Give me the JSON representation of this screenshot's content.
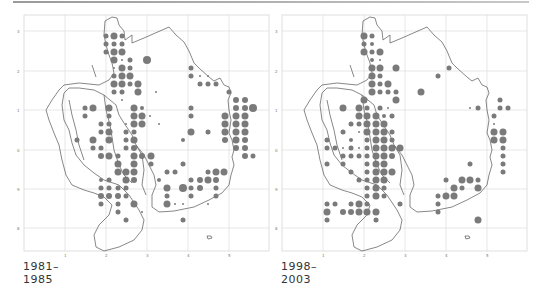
{
  "figure": {
    "panels": [
      {
        "caption": "1981–1985",
        "x_ticks": [
          "1",
          "2",
          "3",
          "4",
          "5"
        ],
        "y_ticks": [
          "3",
          "2",
          "1",
          "0",
          "9",
          "8"
        ]
      },
      {
        "caption": "1998–2003",
        "x_ticks": [
          "1",
          "2",
          "3",
          "4",
          "5"
        ],
        "y_ticks": [
          "3",
          "2",
          "1",
          "0",
          "9",
          "8"
        ]
      }
    ],
    "dot_color": "#7a7a7a",
    "outline_color": "#555555",
    "grid_color": "#d9d9d9"
  },
  "dots": {
    "p1": [
      [
        82,
        5,
        2.5
      ],
      [
        90,
        5,
        3.5
      ],
      [
        98,
        5,
        2.5
      ],
      [
        82,
        13,
        2.5
      ],
      [
        90,
        13,
        2.5
      ],
      [
        98,
        13,
        2.5
      ],
      [
        82,
        21,
        2.5
      ],
      [
        90,
        21,
        3.5
      ],
      [
        98,
        21,
        3.5
      ],
      [
        90,
        29,
        3.5
      ],
      [
        98,
        29,
        1
      ],
      [
        106,
        29,
        2.5
      ],
      [
        123,
        29,
        4
      ],
      [
        90,
        37,
        1
      ],
      [
        98,
        37,
        3.5
      ],
      [
        106,
        37,
        2.5
      ],
      [
        167,
        37,
        2.5
      ],
      [
        90,
        45,
        2.5
      ],
      [
        98,
        45,
        3.5
      ],
      [
        106,
        45,
        3.5
      ],
      [
        167,
        45,
        2.5
      ],
      [
        176,
        45,
        1
      ],
      [
        184,
        45,
        1
      ],
      [
        90,
        53,
        3.5
      ],
      [
        98,
        53,
        3.5
      ],
      [
        106,
        53,
        2.5
      ],
      [
        114,
        53,
        3.5
      ],
      [
        176,
        53,
        2.5
      ],
      [
        184,
        53,
        2.5
      ],
      [
        192,
        53,
        2.5
      ],
      [
        90,
        61,
        2.5
      ],
      [
        98,
        61,
        2.5
      ],
      [
        114,
        61,
        3.5
      ],
      [
        132,
        61,
        1
      ],
      [
        205,
        61,
        2.5
      ],
      [
        98,
        69,
        1
      ],
      [
        212,
        69,
        3
      ],
      [
        221,
        69,
        3
      ],
      [
        61,
        77,
        2.5
      ],
      [
        69,
        77,
        3.5
      ],
      [
        85,
        77,
        3.5
      ],
      [
        110,
        77,
        3.5
      ],
      [
        118,
        77,
        2
      ],
      [
        167,
        77,
        2.5
      ],
      [
        212,
        77,
        3
      ],
      [
        221,
        77,
        3
      ],
      [
        229,
        77,
        4
      ],
      [
        61,
        85,
        2.5
      ],
      [
        85,
        85,
        2.5
      ],
      [
        110,
        85,
        3.5
      ],
      [
        118,
        85,
        3.5
      ],
      [
        126,
        85,
        1
      ],
      [
        167,
        85,
        2.5
      ],
      [
        201,
        85,
        3.5
      ],
      [
        212,
        85,
        3.5
      ],
      [
        221,
        85,
        3.5
      ],
      [
        77,
        93,
        2.5
      ],
      [
        85,
        93,
        2.5
      ],
      [
        102,
        93,
        1
      ],
      [
        110,
        93,
        3.5
      ],
      [
        118,
        93,
        3.5
      ],
      [
        135,
        93,
        1
      ],
      [
        201,
        93,
        3.5
      ],
      [
        212,
        93,
        3.5
      ],
      [
        221,
        93,
        3.5
      ],
      [
        77,
        101,
        2.5
      ],
      [
        85,
        101,
        3.5
      ],
      [
        102,
        101,
        2.5
      ],
      [
        110,
        101,
        2.5
      ],
      [
        167,
        101,
        3.5
      ],
      [
        184,
        101,
        2.5
      ],
      [
        201,
        101,
        3.5
      ],
      [
        212,
        101,
        3.5
      ],
      [
        221,
        101,
        3.5
      ],
      [
        53,
        109,
        2.5
      ],
      [
        69,
        109,
        3.5
      ],
      [
        85,
        109,
        3.5
      ],
      [
        102,
        109,
        2.5
      ],
      [
        110,
        109,
        3.5
      ],
      [
        159,
        109,
        2
      ],
      [
        201,
        109,
        3
      ],
      [
        212,
        109,
        3.5
      ],
      [
        221,
        109,
        3
      ],
      [
        69,
        117,
        2.5
      ],
      [
        77,
        117,
        2.5
      ],
      [
        102,
        117,
        2.5
      ],
      [
        110,
        117,
        3
      ],
      [
        212,
        117,
        3
      ],
      [
        221,
        117,
        3
      ],
      [
        77,
        125,
        3
      ],
      [
        85,
        125,
        3.5
      ],
      [
        94,
        125,
        2.5
      ],
      [
        110,
        125,
        3.5
      ],
      [
        118,
        125,
        3
      ],
      [
        127,
        125,
        3.5
      ],
      [
        221,
        125,
        3
      ],
      [
        229,
        125,
        2.5
      ],
      [
        94,
        133,
        3.5
      ],
      [
        110,
        133,
        3.5
      ],
      [
        127,
        133,
        2.5
      ],
      [
        159,
        133,
        2.5
      ],
      [
        94,
        141,
        3.5
      ],
      [
        102,
        141,
        3.5
      ],
      [
        110,
        141,
        3.5
      ],
      [
        143,
        141,
        2.5
      ],
      [
        151,
        141,
        2.5
      ],
      [
        184,
        141,
        2.5
      ],
      [
        192,
        141,
        3.5
      ],
      [
        200,
        141,
        3.5
      ],
      [
        77,
        149,
        2
      ],
      [
        85,
        149,
        2.5
      ],
      [
        102,
        149,
        3.5
      ],
      [
        110,
        149,
        3
      ],
      [
        135,
        149,
        2
      ],
      [
        167,
        149,
        2.5
      ],
      [
        176,
        149,
        3
      ],
      [
        184,
        149,
        3.5
      ],
      [
        192,
        149,
        3
      ],
      [
        77,
        157,
        2.5
      ],
      [
        85,
        157,
        2.5
      ],
      [
        94,
        157,
        2.5
      ],
      [
        102,
        157,
        2.5
      ],
      [
        143,
        157,
        3.5
      ],
      [
        159,
        157,
        4
      ],
      [
        167,
        157,
        2.5
      ],
      [
        176,
        157,
        3
      ],
      [
        192,
        157,
        2.5
      ],
      [
        77,
        165,
        3
      ],
      [
        85,
        165,
        3
      ],
      [
        94,
        165,
        3
      ],
      [
        102,
        165,
        2.5
      ],
      [
        143,
        165,
        2.5
      ],
      [
        167,
        165,
        2.5
      ],
      [
        192,
        165,
        2.5
      ],
      [
        77,
        173,
        2.5
      ],
      [
        94,
        173,
        2.5
      ],
      [
        110,
        173,
        3.5
      ],
      [
        143,
        173,
        3.5
      ],
      [
        151,
        173,
        1
      ],
      [
        159,
        173,
        1
      ],
      [
        184,
        173,
        1
      ],
      [
        94,
        181,
        2.5
      ],
      [
        118,
        181,
        1
      ],
      [
        102,
        189,
        2.5
      ],
      [
        159,
        189,
        2.5
      ]
    ],
    "p2": [
      [
        82,
        5,
        3.5
      ],
      [
        90,
        5,
        2.5
      ],
      [
        82,
        13,
        2.5
      ],
      [
        90,
        13,
        2
      ],
      [
        82,
        21,
        3.5
      ],
      [
        90,
        21,
        2.5
      ],
      [
        98,
        21,
        3.5
      ],
      [
        90,
        29,
        2
      ],
      [
        98,
        29,
        1
      ],
      [
        90,
        37,
        3.5
      ],
      [
        98,
        37,
        3.5
      ],
      [
        114,
        37,
        3.5
      ],
      [
        167,
        37,
        2.5
      ],
      [
        90,
        45,
        3.5
      ],
      [
        98,
        45,
        2.5
      ],
      [
        156,
        45,
        2.5
      ],
      [
        90,
        53,
        3.5
      ],
      [
        98,
        53,
        2.5
      ],
      [
        106,
        53,
        3.5
      ],
      [
        90,
        61,
        3.5
      ],
      [
        98,
        61,
        2.5
      ],
      [
        106,
        61,
        2.5
      ],
      [
        114,
        61,
        2.5
      ],
      [
        139,
        61,
        3.5
      ],
      [
        82,
        69,
        3.5
      ],
      [
        114,
        69,
        3.5
      ],
      [
        218,
        69,
        2.5
      ],
      [
        61,
        77,
        3.5
      ],
      [
        77,
        77,
        3.5
      ],
      [
        85,
        77,
        2.5
      ],
      [
        98,
        77,
        2.5
      ],
      [
        106,
        77,
        1
      ],
      [
        188,
        77,
        1
      ],
      [
        196,
        77,
        2.5
      ],
      [
        218,
        77,
        2.5
      ],
      [
        226,
        77,
        2.5
      ],
      [
        77,
        85,
        3.5
      ],
      [
        85,
        85,
        3.5
      ],
      [
        94,
        85,
        3.5
      ],
      [
        102,
        85,
        2
      ],
      [
        110,
        85,
        2.5
      ],
      [
        212,
        85,
        2.5
      ],
      [
        69,
        93,
        2.5
      ],
      [
        77,
        93,
        2.5
      ],
      [
        85,
        93,
        3.5
      ],
      [
        94,
        93,
        3.5
      ],
      [
        102,
        93,
        3.5
      ],
      [
        212,
        93,
        1
      ],
      [
        61,
        101,
        2.5
      ],
      [
        77,
        101,
        1
      ],
      [
        85,
        101,
        3.5
      ],
      [
        94,
        101,
        3.5
      ],
      [
        102,
        101,
        3.5
      ],
      [
        110,
        101,
        2.5
      ],
      [
        212,
        101,
        3.5
      ],
      [
        221,
        101,
        3.5
      ],
      [
        45,
        109,
        2.5
      ],
      [
        69,
        109,
        2
      ],
      [
        85,
        109,
        2.5
      ],
      [
        94,
        109,
        3.5
      ],
      [
        102,
        109,
        3.5
      ],
      [
        110,
        109,
        2.5
      ],
      [
        212,
        109,
        3.5
      ],
      [
        221,
        109,
        3.5
      ],
      [
        45,
        117,
        2.5
      ],
      [
        53,
        117,
        2.5
      ],
      [
        61,
        117,
        1
      ],
      [
        69,
        117,
        2.5
      ],
      [
        77,
        117,
        1
      ],
      [
        85,
        117,
        2.5
      ],
      [
        94,
        117,
        3.5
      ],
      [
        102,
        117,
        3.5
      ],
      [
        110,
        117,
        3.5
      ],
      [
        118,
        117,
        3.5
      ],
      [
        221,
        117,
        2.5
      ],
      [
        61,
        125,
        2.5
      ],
      [
        69,
        125,
        2.5
      ],
      [
        77,
        125,
        2.5
      ],
      [
        85,
        125,
        2.5
      ],
      [
        94,
        125,
        3.5
      ],
      [
        102,
        125,
        3.5
      ],
      [
        110,
        125,
        3
      ],
      [
        221,
        125,
        2.5
      ],
      [
        45,
        133,
        2.5
      ],
      [
        61,
        133,
        2.5
      ],
      [
        85,
        133,
        2.5
      ],
      [
        94,
        133,
        3.5
      ],
      [
        102,
        133,
        3.5
      ],
      [
        188,
        133,
        2.5
      ],
      [
        221,
        133,
        2.5
      ],
      [
        69,
        141,
        2.5
      ],
      [
        85,
        141,
        2.5
      ],
      [
        94,
        141,
        3.5
      ],
      [
        102,
        141,
        3.5
      ],
      [
        110,
        141,
        3.5
      ],
      [
        221,
        141,
        2.5
      ],
      [
        77,
        149,
        2.5
      ],
      [
        85,
        149,
        2.5
      ],
      [
        94,
        149,
        3.5
      ],
      [
        102,
        149,
        3.5
      ],
      [
        164,
        149,
        2.5
      ],
      [
        180,
        149,
        3.5
      ],
      [
        188,
        149,
        3.5
      ],
      [
        196,
        149,
        2.5
      ],
      [
        85,
        157,
        2.5
      ],
      [
        94,
        157,
        3.5
      ],
      [
        102,
        157,
        2.5
      ],
      [
        172,
        157,
        3.5
      ],
      [
        180,
        157,
        2.5
      ],
      [
        196,
        157,
        3.5
      ],
      [
        85,
        165,
        2.5
      ],
      [
        94,
        165,
        3.5
      ],
      [
        102,
        165,
        2.5
      ],
      [
        156,
        165,
        2.5
      ],
      [
        164,
        165,
        3.5
      ],
      [
        172,
        165,
        3.5
      ],
      [
        45,
        173,
        2.5
      ],
      [
        53,
        173,
        2.5
      ],
      [
        69,
        173,
        2.5
      ],
      [
        77,
        173,
        3.5
      ],
      [
        85,
        173,
        2.5
      ],
      [
        118,
        173,
        2.5
      ],
      [
        156,
        173,
        2.5
      ],
      [
        45,
        181,
        3.5
      ],
      [
        61,
        181,
        3
      ],
      [
        69,
        181,
        3
      ],
      [
        77,
        181,
        3.5
      ],
      [
        85,
        181,
        3.5
      ],
      [
        94,
        181,
        3.5
      ],
      [
        156,
        181,
        2.5
      ],
      [
        45,
        189,
        2.5
      ],
      [
        94,
        189,
        2.5
      ],
      [
        196,
        189,
        3.5
      ]
    ]
  }
}
